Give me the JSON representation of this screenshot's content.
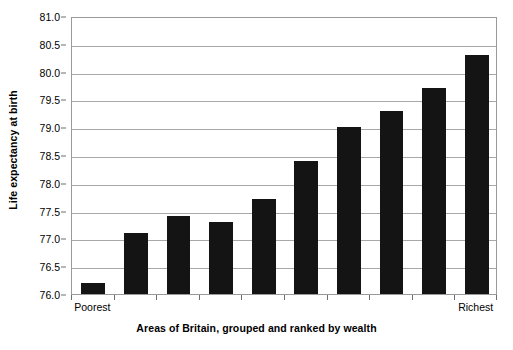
{
  "chart_data": {
    "type": "bar",
    "title": "",
    "xlabel": "Areas of Britain, grouped and ranked by wealth",
    "ylabel": "Life expectancy at birth",
    "ylim": [
      76.0,
      81.0
    ],
    "ytick_step": 0.5,
    "ytick_labels": [
      "81.0",
      "80.5",
      "80.0",
      "79.5",
      "79.0",
      "78.5",
      "78.0",
      "77.5",
      "77.0",
      "76.5",
      "76.0"
    ],
    "ytick_values": [
      81.0,
      80.5,
      80.0,
      79.5,
      79.0,
      78.5,
      78.0,
      77.5,
      77.0,
      76.5,
      76.0
    ],
    "grid": "horizontal",
    "legend": "none",
    "bar_color": "#141414",
    "plot_background": "#ffffff",
    "gridline_color": "#a8a8a8",
    "border_color": "#9a9a9a",
    "categories": [
      "1",
      "2",
      "3",
      "4",
      "5",
      "6",
      "7",
      "8",
      "9",
      "10"
    ],
    "category_labels_shown": {
      "first": "Poorest",
      "last": "Richest"
    },
    "values": [
      76.2,
      77.1,
      77.4,
      77.3,
      77.7,
      78.4,
      79.0,
      79.3,
      79.7,
      80.3
    ],
    "series": [
      {
        "name": "Life expectancy at birth",
        "values": [
          76.2,
          77.1,
          77.4,
          77.3,
          77.7,
          78.4,
          79.0,
          79.3,
          79.7,
          80.3
        ]
      }
    ]
  }
}
